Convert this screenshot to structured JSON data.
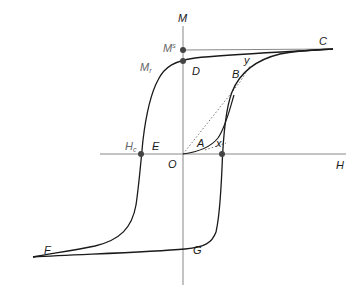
{
  "diagram": {
    "axes": {
      "vertical_label": "M",
      "horizontal_label": "H"
    },
    "points": {
      "origin": "O",
      "saturation_magnetization": {
        "base": "M",
        "sup": "s"
      },
      "remanence": {
        "base": "M",
        "sub": "r"
      },
      "coercivity": {
        "base": "H",
        "sub": "c"
      },
      "A": "A",
      "B": "B",
      "C": "C",
      "D": "D",
      "E": "E",
      "F": "F",
      "G": "G",
      "x": "x",
      "y": "y"
    },
    "colors": {
      "curve": "#1a1a1a",
      "axis": "#777777",
      "dot": "#444444",
      "dotted": "#666666"
    }
  }
}
